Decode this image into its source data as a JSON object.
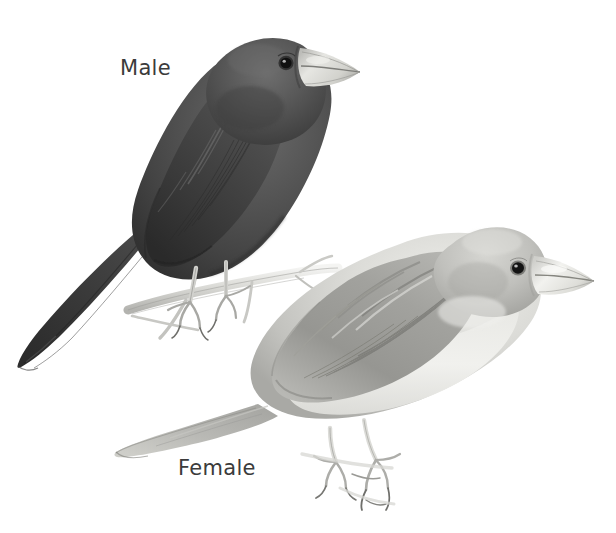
{
  "plate": {
    "width": 616,
    "height": 533,
    "background_color": "#ffffff",
    "medium": "graphite pencil field-guide illustration",
    "subject": "perching finch-like songbird, sexual dimorphism plate",
    "label_color": "#3b3b3b"
  },
  "labels": {
    "male": "Male",
    "female": "Female"
  },
  "figures": [
    {
      "id": "male-bird",
      "label": "Male",
      "pose": "perched on thin twig, facing upper right, tail angled down to lower left",
      "body_color": "#4a4a4a",
      "shadow_color": "#2e2e2e",
      "highlight_color": "#6e6e6e",
      "beak_color": "#d8d8d4",
      "eye_color": "#1a1a1a",
      "leg_color": "#b9b9b6",
      "bbox": [
        14,
        20,
        366,
        372
      ]
    },
    {
      "id": "female-bird",
      "label": "Female",
      "pose": "perched on twig, facing right, tail extending to lower left",
      "body_color": "#b6b6b2",
      "shadow_color": "#8a8a86",
      "highlight_color": "#e2e2df",
      "belly_color": "#efefec",
      "beak_color": "#e4e4e0",
      "eye_color": "#151515",
      "leg_color": "#c6c6c2",
      "bbox": [
        112,
        226,
        596,
        516
      ]
    }
  ],
  "perches": [
    {
      "id": "male-perch",
      "description": "slender pale twig with small side shoots",
      "color": "#cfcfcb"
    },
    {
      "id": "female-perch",
      "description": "thin twig beneath female's feet",
      "color": "#cfcfcb"
    }
  ]
}
